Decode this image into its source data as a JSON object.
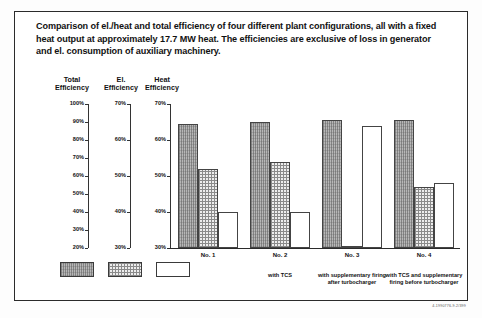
{
  "title": "Comparison of el./heat and total efficiency of four different plant configurations, all with a fixed heat output at approximately 17.7 MW heat. The efficiencies are exclusive of loss in generator and el. consumption of auxiliary machinery.",
  "axis_titles": {
    "total": "Total\nEfficiency",
    "total_line1": "Total",
    "total_line2": "Efficiency",
    "el_line1": "El.",
    "el_line2": "Efficiency",
    "heat_line1": "Heat",
    "heat_line2": "Efficiency"
  },
  "figure_code": "4-1990776-9.2/399",
  "chart_data": {
    "type": "bar",
    "title": "Comparison of el./heat and total efficiency of four different plant configurations",
    "categories": [
      "No. 1",
      "No. 2",
      "No. 3",
      "No. 4"
    ],
    "category_captions": [
      "",
      "with TCS",
      "with supplementary firing after turbocharger",
      "with TCS and supplementary firing before turbocharger"
    ],
    "series": [
      {
        "name": "Total Efficiency",
        "axis": "total",
        "fill": "hatch",
        "values": [
          89,
          90,
          91,
          91
        ]
      },
      {
        "name": "El. Efficiency",
        "axis": "el",
        "fill": "dot",
        "values": [
          52,
          54,
          30,
          47
        ]
      },
      {
        "name": "Heat Efficiency",
        "axis": "heat",
        "fill": "white",
        "values": [
          40,
          40,
          64,
          48
        ]
      }
    ],
    "axes": {
      "total": {
        "label": "Total Efficiency",
        "ticks": [
          "100%",
          "90%",
          "80%",
          "70%",
          "60%",
          "50%",
          "40%",
          "30%",
          "20%"
        ],
        "min": 20,
        "max": 100
      },
      "el": {
        "label": "El. Efficiency",
        "ticks": [
          "70%",
          "60%",
          "50%",
          "40%",
          "30%"
        ],
        "min": 30,
        "max": 70
      },
      "heat": {
        "label": "Heat Efficiency",
        "ticks": [
          "70%",
          "60%",
          "50%",
          "40%",
          "30%"
        ],
        "min": 30,
        "max": 70
      }
    },
    "grid": false,
    "legend": [
      "Total Efficiency",
      "El. Efficiency",
      "Heat Efficiency"
    ]
  }
}
